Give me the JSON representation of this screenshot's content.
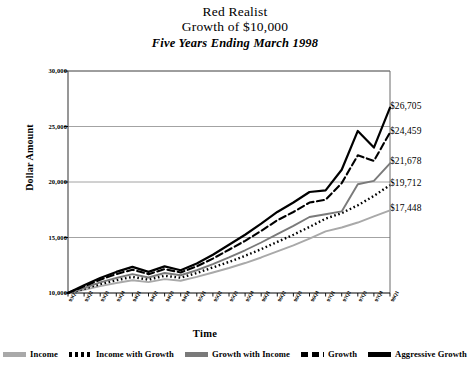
{
  "chart_data": {
    "type": "line",
    "title": "Red Realist",
    "subtitle": "Growth of $10,000",
    "subtitle2": "Five Years Ending March 1998",
    "xlabel": "Time",
    "ylabel": "Dollar Amount",
    "ylim": [
      10000,
      30000
    ],
    "yticks": [
      "10,000",
      "15,000",
      "20,000",
      "25,000",
      "30,000"
    ],
    "ytick_values": [
      10000,
      15000,
      20000,
      25000,
      30000
    ],
    "grid": true,
    "legend_position": "bottom",
    "categories": [
      "93Q1",
      "93Q2",
      "93Q3",
      "93Q4",
      "94Q1",
      "94Q2",
      "94Q3",
      "94Q4",
      "95Q1",
      "95Q2",
      "95Q3",
      "95Q4",
      "96Q1",
      "96Q2",
      "96Q3",
      "96Q4",
      "97Q1",
      "97Q2",
      "97Q3",
      "97Q4",
      "98Q1"
    ],
    "series": [
      {
        "name": "Income",
        "color": "#a9a9a9",
        "style": "solid",
        "end_label": "$17,448",
        "values": [
          10000,
          10280,
          10620,
          10900,
          11150,
          10980,
          11250,
          11100,
          11450,
          11850,
          12250,
          12700,
          13200,
          13750,
          14300,
          14900,
          15550,
          15900,
          16350,
          16900,
          17448
        ]
      },
      {
        "name": "Income with Growth",
        "color": "#000000",
        "style": "dotted",
        "end_label": "$19,712",
        "values": [
          10000,
          10380,
          10800,
          11150,
          11450,
          11200,
          11550,
          11380,
          11800,
          12300,
          12800,
          13350,
          13950,
          14600,
          15250,
          15950,
          16700,
          17200,
          17900,
          18750,
          19712
        ]
      },
      {
        "name": "Growth with Income",
        "color": "#7a7a7a",
        "style": "solid",
        "end_label": "$21,678",
        "values": [
          10000,
          10450,
          10950,
          11350,
          11700,
          11400,
          11800,
          11600,
          12050,
          12600,
          13200,
          13850,
          14550,
          15300,
          16050,
          16850,
          17100,
          17350,
          19800,
          20100,
          21678
        ]
      },
      {
        "name": "Growth",
        "color": "#000000",
        "style": "dashed",
        "end_label": "$24,459",
        "values": [
          10000,
          10600,
          11200,
          11700,
          12100,
          11700,
          12150,
          11850,
          12400,
          13100,
          13900,
          14700,
          15600,
          16550,
          17300,
          18150,
          18400,
          19900,
          22400,
          21900,
          24459
        ]
      },
      {
        "name": "Aggressive Growth",
        "color": "#000000",
        "style": "solid",
        "end_label": "$26,705",
        "values": [
          10000,
          10700,
          11350,
          11900,
          12350,
          11900,
          12400,
          12050,
          12650,
          13450,
          14350,
          15250,
          16250,
          17300,
          18150,
          19100,
          19250,
          21100,
          24600,
          23100,
          26705
        ]
      }
    ]
  }
}
